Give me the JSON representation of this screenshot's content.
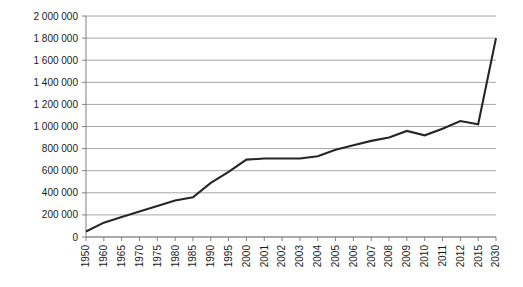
{
  "chart_data": {
    "type": "line",
    "title": "",
    "subtitle": "",
    "xlabel": "",
    "ylabel": "",
    "categories": [
      "1950",
      "1960",
      "1965",
      "1970",
      "1975",
      "1980",
      "1985",
      "1990",
      "1995",
      "2000",
      "2001",
      "2002",
      "2003",
      "2004",
      "2005",
      "2006",
      "2007",
      "2008",
      "2009",
      "2010",
      "2011",
      "2012",
      "2015",
      "2030"
    ],
    "values": [
      50000,
      130000,
      180000,
      230000,
      280000,
      330000,
      360000,
      490000,
      590000,
      700000,
      710000,
      710000,
      710000,
      730000,
      790000,
      830000,
      870000,
      900000,
      960000,
      920000,
      980000,
      1050000,
      1020000,
      1800000
    ],
    "series": [
      {
        "name": "",
        "values": [
          50000,
          130000,
          180000,
          230000,
          280000,
          330000,
          360000,
          490000,
          590000,
          700000,
          710000,
          710000,
          710000,
          730000,
          790000,
          830000,
          870000,
          900000,
          960000,
          920000,
          980000,
          1050000,
          1020000,
          1800000
        ]
      }
    ],
    "ylim": [
      0,
      2000000
    ],
    "ytick_values": [
      0,
      200000,
      400000,
      600000,
      800000,
      1000000,
      1200000,
      1400000,
      1600000,
      1800000,
      2000000
    ],
    "ytick_labels": [
      "0",
      "200 000",
      "400 000",
      "600 000",
      "800 000",
      "1 000 000",
      "1 200 000",
      "1 400 000",
      "1 600 000",
      "1 800 000",
      "2 000 000"
    ],
    "grid": true,
    "grid_axis": "y",
    "legend": false,
    "legend_position": "none",
    "annotations": [],
    "line_color": "#262626",
    "grid_color": "#a6a6a6",
    "axis_color": "#808080",
    "background_color": "#ffffff",
    "text_color": "#1a1a1a"
  },
  "layout": {
    "plot_left": 86,
    "plot_right": 496,
    "plot_top": 16,
    "plot_bottom": 237,
    "tick_length": 4,
    "xlabel_rotation": -90
  }
}
